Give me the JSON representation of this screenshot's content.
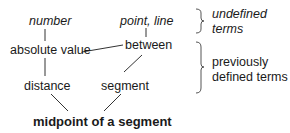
{
  "diagram": {
    "nodes": {
      "number": "number",
      "point_line": "point, line",
      "absolute_value": "absolute value",
      "between": "between",
      "distance": "distance",
      "segment": "segment",
      "midpoint": "midpoint of a segment"
    },
    "annotations": {
      "undefined_line1": "undefined",
      "undefined_line2": "terms",
      "previous_line1": "previously",
      "previous_line2": "defined terms"
    },
    "edges": [
      [
        "number",
        "absolute_value"
      ],
      [
        "point_line",
        "between"
      ],
      [
        "absolute_value",
        "between"
      ],
      [
        "absolute_value",
        "distance"
      ],
      [
        "between",
        "segment"
      ],
      [
        "distance",
        "midpoint"
      ],
      [
        "segment",
        "midpoint"
      ]
    ],
    "colors": {
      "text": "#1a1a1a",
      "line": "#333333",
      "brace": "#555555"
    }
  }
}
